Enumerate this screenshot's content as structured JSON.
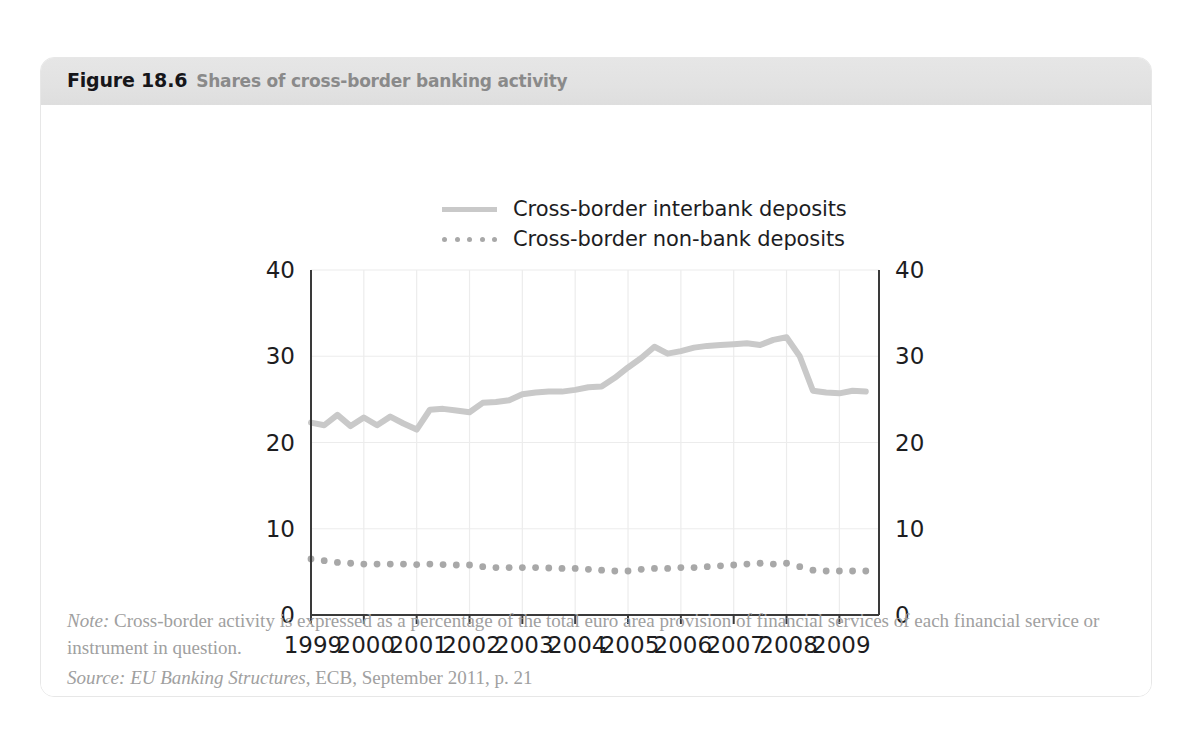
{
  "figure": {
    "number": "Figure 18.6",
    "caption": "Shares of cross-border banking activity"
  },
  "legend": [
    {
      "label": "Cross-border interbank deposits",
      "style": "solid",
      "color": "#c9c9c9"
    },
    {
      "label": "Cross-border non-bank deposits",
      "style": "dotted",
      "color": "#a8a8a8"
    }
  ],
  "footnotes": {
    "note_prefix": "Note:",
    "note_text": " Cross-border activity is expressed as a percentage of the total euro area provision of financial services of each financial service or instrument in question.",
    "source_prefix": "Source:",
    "source_title": " EU Banking Structures",
    "source_rest": ", ECB, September 2011, p. 21"
  },
  "chart_data": {
    "type": "line",
    "title": "Shares of cross-border banking activity",
    "xlabel": "",
    "ylabel": "",
    "xlim": [
      1999,
      2009.75
    ],
    "ylim": [
      0,
      40
    ],
    "yticks": [
      0,
      10,
      20,
      30,
      40
    ],
    "ytick_labels_left": [
      "0",
      "10",
      "20",
      "30",
      "40"
    ],
    "ytick_labels_right": [
      "0",
      "10",
      "20",
      "30",
      "40"
    ],
    "xticks": [
      1999,
      2000,
      2001,
      2002,
      2003,
      2004,
      2005,
      2006,
      2007,
      2008,
      2009
    ],
    "xtick_labels": [
      "1999",
      "2000",
      "2001",
      "2002",
      "2003",
      "2004",
      "2005",
      "2006",
      "2007",
      "2008",
      "2009"
    ],
    "grid": "horizontal-and-vertical-light",
    "legend_position": "above-plot",
    "series": [
      {
        "name": "Cross-border interbank deposits",
        "style": "solid",
        "color": "#c9c9c9",
        "x": [
          1999.0,
          1999.25,
          1999.5,
          1999.75,
          2000.0,
          2000.25,
          2000.5,
          2000.75,
          2001.0,
          2001.25,
          2001.5,
          2001.75,
          2002.0,
          2002.25,
          2002.5,
          2002.75,
          2003.0,
          2003.25,
          2003.5,
          2003.75,
          2004.0,
          2004.25,
          2004.5,
          2004.75,
          2005.0,
          2005.25,
          2005.5,
          2005.75,
          2006.0,
          2006.25,
          2006.5,
          2006.75,
          2007.0,
          2007.25,
          2007.5,
          2007.75,
          2008.0,
          2008.25,
          2008.5,
          2008.75,
          2009.0,
          2009.25,
          2009.5
        ],
        "values": [
          22.3,
          22.0,
          23.2,
          21.9,
          22.9,
          22.0,
          23.0,
          22.2,
          21.5,
          23.8,
          23.9,
          23.7,
          23.5,
          24.6,
          24.7,
          24.9,
          25.6,
          25.8,
          25.9,
          25.9,
          26.1,
          26.4,
          26.5,
          27.5,
          28.7,
          29.8,
          31.1,
          30.3,
          30.6,
          31.0,
          31.2,
          31.3,
          31.4,
          31.5,
          31.3,
          31.9,
          32.2,
          30.0,
          26.0,
          25.8,
          25.7,
          26.0,
          25.9
        ]
      },
      {
        "name": "Cross-border non-bank deposits",
        "style": "dotted",
        "color": "#a8a8a8",
        "x": [
          1999.0,
          1999.25,
          1999.5,
          1999.75,
          2000.0,
          2000.25,
          2000.5,
          2000.75,
          2001.0,
          2001.25,
          2001.5,
          2001.75,
          2002.0,
          2002.25,
          2002.5,
          2002.75,
          2003.0,
          2003.25,
          2003.5,
          2003.75,
          2004.0,
          2004.25,
          2004.5,
          2004.75,
          2005.0,
          2005.25,
          2005.5,
          2005.75,
          2006.0,
          2006.25,
          2006.5,
          2006.75,
          2007.0,
          2007.25,
          2007.5,
          2007.75,
          2008.0,
          2008.25,
          2008.5,
          2008.75,
          2009.0,
          2009.25,
          2009.5
        ],
        "values": [
          6.5,
          6.3,
          6.1,
          6.0,
          5.9,
          5.9,
          5.9,
          5.9,
          5.85,
          5.9,
          5.85,
          5.8,
          5.8,
          5.6,
          5.5,
          5.5,
          5.5,
          5.5,
          5.45,
          5.4,
          5.4,
          5.3,
          5.2,
          5.1,
          5.1,
          5.3,
          5.4,
          5.4,
          5.5,
          5.5,
          5.6,
          5.7,
          5.8,
          5.9,
          6.0,
          5.9,
          6.0,
          5.6,
          5.2,
          5.1,
          5.1,
          5.1,
          5.1
        ]
      }
    ]
  }
}
